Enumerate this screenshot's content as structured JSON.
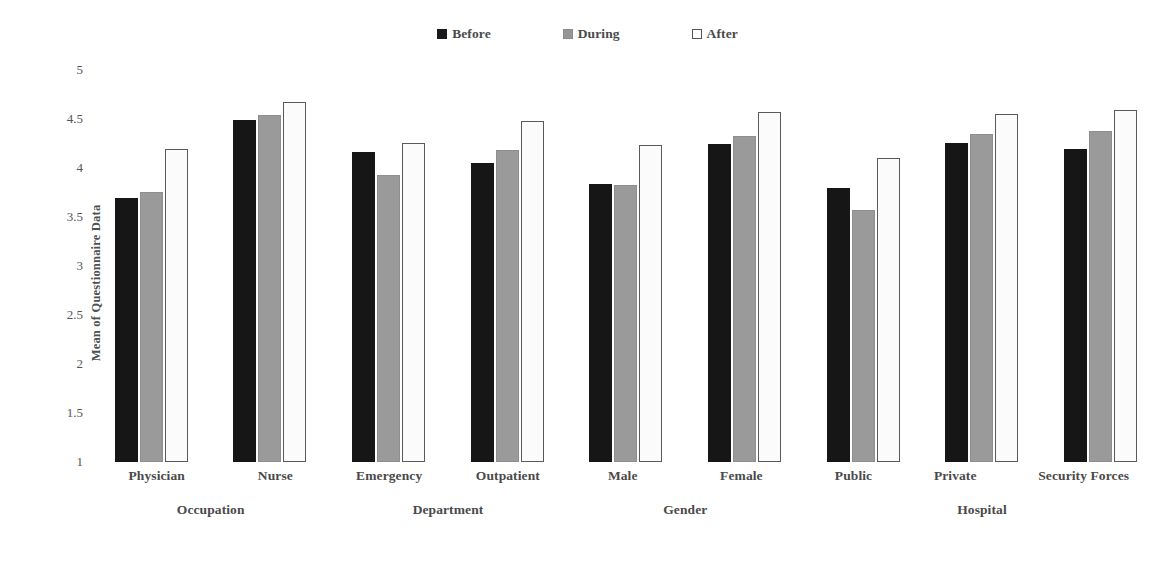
{
  "chart_data": {
    "type": "bar",
    "title": "",
    "subtitle": "",
    "xlabel": "",
    "ylabel": "Mean of Questionnaire Data",
    "ylim": [
      1,
      5
    ],
    "ytick_labels": [
      "5",
      "4.5",
      "4",
      "3.5",
      "3",
      "2.5",
      "2",
      "1.5",
      "1"
    ],
    "ytick_values": [
      5,
      4.5,
      4,
      3.5,
      3,
      2.5,
      2,
      1.5,
      1
    ],
    "grid": false,
    "legend_position": "top-center",
    "categories": [
      "Physician",
      "Nurse",
      "Emergency",
      "Outpatient",
      "Male",
      "Female",
      "Public",
      "Private",
      "Security Forces"
    ],
    "series": [
      {
        "name": "Before",
        "color": "#161616",
        "values": [
          3.69,
          4.49,
          4.16,
          4.05,
          3.84,
          4.25,
          3.8,
          4.26,
          4.19
        ]
      },
      {
        "name": "During",
        "color": "#9a9a9a",
        "values": [
          3.76,
          4.54,
          3.93,
          4.18,
          3.83,
          4.33,
          3.57,
          4.35,
          4.38
        ]
      },
      {
        "name": "After",
        "color": "#ffffff",
        "values": [
          4.19,
          4.67,
          4.26,
          4.48,
          4.23,
          4.57,
          4.1,
          4.55,
          4.59
        ]
      }
    ],
    "groups": [
      {
        "label": "Occupation",
        "categories": [
          "Physician",
          "Nurse"
        ]
      },
      {
        "label": "Department",
        "categories": [
          "Emergency",
          "Outpatient"
        ]
      },
      {
        "label": "Gender",
        "categories": [
          "Male",
          "Female"
        ]
      },
      {
        "label": "Hospital",
        "categories": [
          "Public",
          "Private",
          "Security Forces"
        ]
      }
    ]
  },
  "legend": {
    "items": [
      {
        "label": "Before",
        "swatch": "filled-black-square-icon"
      },
      {
        "label": "During",
        "swatch": "filled-gray-square-icon"
      },
      {
        "label": "After",
        "swatch": "outlined-white-square-icon"
      }
    ]
  }
}
